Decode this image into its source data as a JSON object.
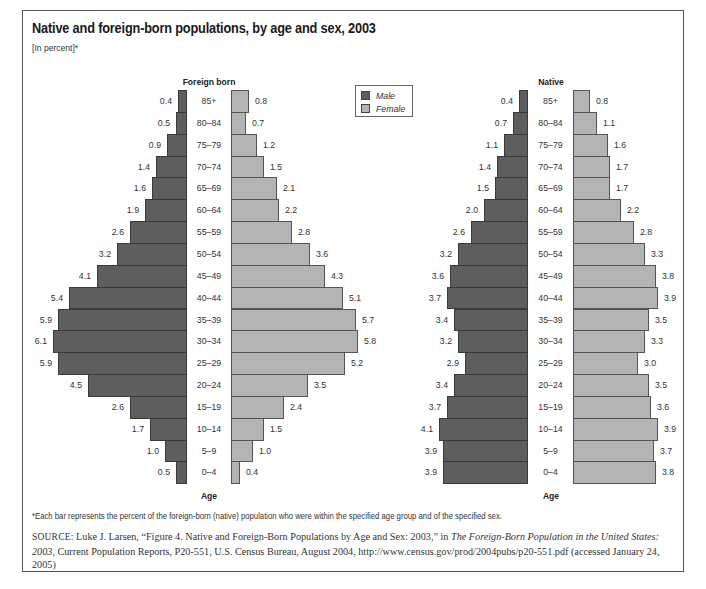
{
  "figure": {
    "title": "Native and foreign-born populations, by age and sex, 2003",
    "subtitle": "[In percent]*",
    "footnote": "*Each bar represents the percent of the foreign-born (native) population who were within the specified age group and of the specified sex.",
    "source": {
      "label": "SOURCE:",
      "text_before_italic": "Luke J. Larsen, “Figure 4. Native and Foreign-Born Populations by Age and Sex: 2003,” in ",
      "italic_title": "The Foreign-Born Population in the United States: 2003",
      "text_after_italic": ", Current Population Reports, P20-551, U.S. Census Bureau, August 2004, http://www.census.gov/prod/2004pubs/p20-551.pdf (accessed January 24, 2005)"
    },
    "legend": {
      "male_label": "Male",
      "female_label": "Female",
      "male_color": "#5e5e5e",
      "female_color": "#b4b4b4"
    },
    "axis_label": "Age"
  },
  "chart_data": [
    {
      "type": "bar",
      "orientation": "horizontal-population-pyramid",
      "title": "Foreign born",
      "xlabel": "",
      "ylabel": "Age",
      "units": "percent",
      "categories": [
        "85+",
        "80–84",
        "75–79",
        "70–74",
        "65–69",
        "60–64",
        "55–59",
        "50–54",
        "45–49",
        "40–44",
        "35–39",
        "30–34",
        "25–29",
        "20–24",
        "15–19",
        "10–14",
        "5–9",
        "0–4"
      ],
      "series": [
        {
          "name": "Male",
          "color": "#5e5e5e",
          "values": [
            0.4,
            0.5,
            0.9,
            1.4,
            1.6,
            1.9,
            2.6,
            3.2,
            4.1,
            5.4,
            5.9,
            6.1,
            5.9,
            4.5,
            2.6,
            1.7,
            1.0,
            0.5
          ]
        },
        {
          "name": "Female",
          "color": "#b4b4b4",
          "values": [
            0.8,
            0.7,
            1.2,
            1.5,
            2.1,
            2.2,
            2.8,
            3.6,
            4.3,
            5.1,
            5.7,
            5.8,
            5.2,
            3.5,
            2.4,
            1.5,
            1.0,
            0.4
          ]
        }
      ],
      "legend_position": "top-right",
      "grid": false
    },
    {
      "type": "bar",
      "orientation": "horizontal-population-pyramid",
      "title": "Native",
      "xlabel": "",
      "ylabel": "Age",
      "units": "percent",
      "categories": [
        "85+",
        "80–84",
        "75–79",
        "70–74",
        "65–69",
        "60–64",
        "55–59",
        "50–54",
        "45–49",
        "40–44",
        "35–39",
        "30–34",
        "25–29",
        "20–24",
        "15–19",
        "10–14",
        "5–9",
        "0–4"
      ],
      "series": [
        {
          "name": "Male",
          "color": "#5e5e5e",
          "values": [
            0.4,
            0.7,
            1.1,
            1.4,
            1.5,
            2.0,
            2.6,
            3.2,
            3.6,
            3.7,
            3.4,
            3.2,
            2.9,
            3.4,
            3.7,
            4.1,
            3.9,
            3.9
          ]
        },
        {
          "name": "Female",
          "color": "#b4b4b4",
          "values": [
            0.8,
            1.1,
            1.6,
            1.7,
            1.7,
            2.2,
            2.8,
            3.3,
            3.8,
            3.9,
            3.5,
            3.3,
            3.0,
            3.5,
            3.6,
            3.9,
            3.7,
            3.8
          ]
        }
      ],
      "legend_position": "top-right",
      "grid": false
    }
  ]
}
